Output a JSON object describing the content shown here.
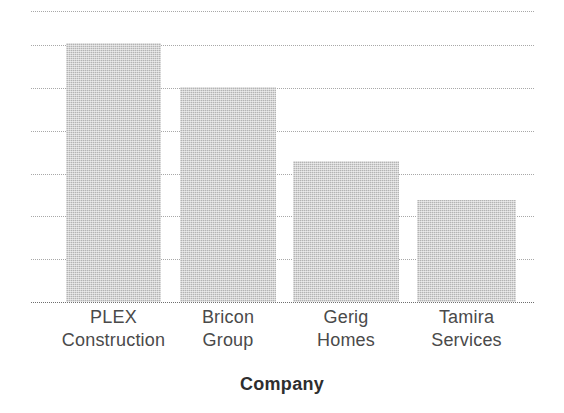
{
  "chart_data": {
    "type": "bar",
    "title": "",
    "subtitle": "",
    "xlabel": "Company",
    "ylabel": "",
    "categories": [
      "PLEX Construction",
      "Bricon Group",
      "Gerig Homes",
      "Tamira Services"
    ],
    "category_lines": [
      [
        "PLEX",
        "Construction"
      ],
      [
        "Bricon",
        "Group"
      ],
      [
        "Gerig",
        "Homes"
      ],
      [
        "Tamira",
        "Services"
      ]
    ],
    "values": [
      6.05,
      5.02,
      3.3,
      2.38
    ],
    "ylim": [
      0,
      6.8
    ],
    "y_tick_values": [
      0,
      1,
      2,
      3,
      4,
      5,
      6,
      6.8
    ],
    "y_tick_labels": [
      "",
      "",
      "",
      "",
      "",
      "",
      "",
      ""
    ],
    "grid": true,
    "grid_style": "dotted",
    "grid_axis": "y",
    "legend": "none",
    "legend_position": "none",
    "bar_color": "#b4b4b4",
    "bar_texture": "dithered-halftone-gray",
    "grid_color": "#9a9a9a",
    "axis_color": "#6f6f6f",
    "text_color": "#4a4a4a",
    "background": "#ffffff",
    "annotations": []
  },
  "axis": {
    "x_title": "Company"
  }
}
